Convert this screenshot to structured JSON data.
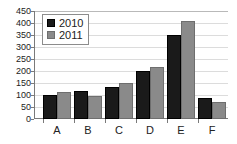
{
  "chart_data": {
    "type": "bar",
    "title": "",
    "subtitle": "",
    "xlabel": "",
    "ylabel": "",
    "categories": [
      "A",
      "B",
      "C",
      "D",
      "E",
      "F"
    ],
    "series": [
      {
        "name": "2010",
        "color": "#1a1a1a",
        "values": [
          100,
          115,
          132,
          200,
          348,
          88
        ]
      },
      {
        "name": "2011",
        "color": "#8a8a8a",
        "values": [
          112,
          97,
          148,
          218,
          408,
          70
        ]
      }
    ],
    "ylim": [
      0,
      450
    ],
    "ytick_step": 50,
    "yticks": [
      0,
      50,
      100,
      150,
      200,
      250,
      300,
      350,
      400,
      450
    ],
    "ytick_labels": [
      "0",
      "50",
      "100",
      "150",
      "200",
      "250",
      "300",
      "350",
      "400",
      "450"
    ],
    "grid": true,
    "grid_axis": "y",
    "legend_position": "top-left",
    "legend_entries": [
      "2010",
      "2011"
    ],
    "background_color": "#ffffff",
    "axis_color": "#7a7a7a",
    "gridline_color": "#dcdcdc"
  }
}
